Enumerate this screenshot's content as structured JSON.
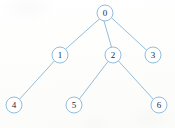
{
  "diagram": {
    "type": "rooted-tree",
    "canvas": {
      "width": 175,
      "height": 128
    },
    "style": {
      "edge_color": "#86b6d8",
      "node_stroke_color": "#86b6d8",
      "node_fill_color": "#ffffff",
      "label_color": "#1d2b3a",
      "background_color": "#fdfdfc",
      "node_radius": 8,
      "stroke_width": 0.9
    },
    "nodes": [
      {
        "id": "0",
        "label": "0",
        "cx": 105,
        "cy": 13,
        "r": 8,
        "depth": 0
      },
      {
        "id": "1",
        "label": "1",
        "cx": 60,
        "cy": 55,
        "r": 8,
        "depth": 1
      },
      {
        "id": "2",
        "label": "2",
        "cx": 113,
        "cy": 55,
        "r": 8,
        "depth": 1
      },
      {
        "id": "3",
        "label": "3",
        "cx": 153,
        "cy": 55,
        "r": 8,
        "depth": 1
      },
      {
        "id": "4",
        "label": "4",
        "cx": 14,
        "cy": 105,
        "r": 8,
        "depth": 2
      },
      {
        "id": "5",
        "label": "5",
        "cx": 74,
        "cy": 105,
        "r": 8,
        "depth": 2
      },
      {
        "id": "6",
        "label": "6",
        "cx": 159,
        "cy": 105,
        "r": 8,
        "depth": 2
      }
    ],
    "edges": [
      {
        "id": "0-1",
        "from": "0",
        "to": "1",
        "x1": 99.5,
        "y1": 18.8,
        "x2": 65.5,
        "y2": 49.2
      },
      {
        "id": "0-2",
        "from": "0",
        "to": "2",
        "x1": 104.0,
        "y1": 21.0,
        "x2": 111.5,
        "y2": 47.0
      },
      {
        "id": "0-3",
        "from": "0",
        "to": "3",
        "x1": 111.8,
        "y1": 18.0,
        "x2": 147.0,
        "y2": 50.5
      },
      {
        "id": "1-4",
        "from": "1",
        "to": "4",
        "x1": 54.5,
        "y1": 60.8,
        "x2": 19.5,
        "y2": 99.2
      },
      {
        "id": "2-5",
        "from": "2",
        "to": "5",
        "x1": 108.0,
        "y1": 61.5,
        "x2": 79.5,
        "y2": 98.8
      },
      {
        "id": "2-6",
        "from": "2",
        "to": "6",
        "x1": 118.5,
        "y1": 61.0,
        "x2": 153.5,
        "y2": 99.5
      }
    ]
  }
}
